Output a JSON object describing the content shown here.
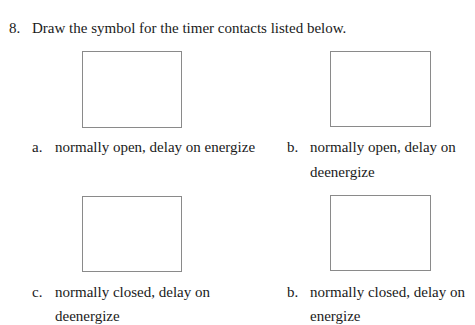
{
  "question": {
    "number": "8.",
    "text": "Draw the symbol for the timer contacts listed below."
  },
  "items": [
    {
      "letter": "a.",
      "line1": "normally open, delay on energize",
      "line2": ""
    },
    {
      "letter": "b.",
      "line1": "normally open, delay on",
      "line2": "deenergize"
    },
    {
      "letter": "c.",
      "line1": "normally closed, delay on",
      "line2": "deenergize"
    },
    {
      "letter": "b.",
      "line1": "normally closed, delay on",
      "line2": "energize"
    }
  ]
}
